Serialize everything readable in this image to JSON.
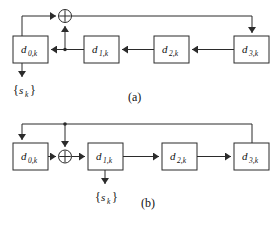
{
  "figure": {
    "title_visible": false,
    "background_color": "#ffffff",
    "line_color": "#3a3a3a",
    "box_fill": "#ffffff",
    "box_stroke": "#2b2b2b",
    "text_color": "#111111",
    "panels": [
      {
        "id": "panel-a",
        "caption": "(a)",
        "type": "lfsr-fibonacci",
        "registers": [
          {
            "id": "d0",
            "base": "d",
            "subscript": "0,k",
            "label": "d0,k"
          },
          {
            "id": "d1",
            "base": "d",
            "subscript": "1,k",
            "label": "d1,k"
          },
          {
            "id": "d2",
            "base": "d",
            "subscript": "2,k",
            "label": "d2,k"
          },
          {
            "id": "d3",
            "base": "d",
            "subscript": "3,k",
            "label": "d3,k"
          }
        ],
        "adder": {
          "id": "xor-a",
          "glyph": "⊕",
          "name": "modulo-2-adder"
        },
        "output": {
          "open_brace": "{",
          "base": "s",
          "subscript": "k",
          "close_brace": "}",
          "label": "{sk}"
        },
        "shift_direction": "right-to-left",
        "feedback_taps": [
          "d0",
          "d1"
        ]
      },
      {
        "id": "panel-b",
        "caption": "(b)",
        "type": "lfsr-galois",
        "registers": [
          {
            "id": "d0",
            "base": "d",
            "subscript": "0,k",
            "label": "d0,k"
          },
          {
            "id": "d1",
            "base": "d",
            "subscript": "1,k",
            "label": "d1,k"
          },
          {
            "id": "d2",
            "base": "d",
            "subscript": "2,k",
            "label": "d2,k"
          },
          {
            "id": "d3",
            "base": "d",
            "subscript": "3,k",
            "label": "d3,k"
          }
        ],
        "adder": {
          "id": "xor-b",
          "glyph": "⊕",
          "name": "modulo-2-adder"
        },
        "output": {
          "open_brace": "{",
          "base": "s",
          "subscript": "k",
          "close_brace": "}",
          "label": "{sk}"
        },
        "shift_direction": "left-to-right",
        "feedback_taps": [
          "d3"
        ]
      }
    ]
  }
}
